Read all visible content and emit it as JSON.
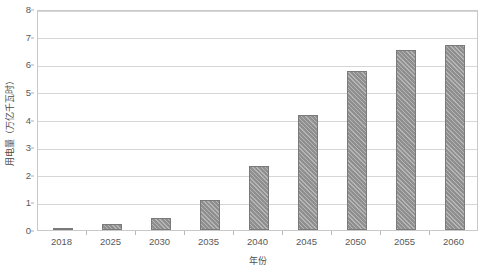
{
  "chart_data": {
    "type": "bar",
    "title": "",
    "subtitle": "",
    "xlabel": "年份",
    "ylabel": "用电量（万亿千瓦时）",
    "categories": [
      "2018",
      "2025",
      "2030",
      "2035",
      "2040",
      "2045",
      "2050",
      "2055",
      "2060"
    ],
    "values": [
      0.07,
      0.2,
      0.45,
      1.1,
      2.3,
      4.15,
      5.75,
      6.5,
      6.7
    ],
    "series": [
      {
        "name": "用电量",
        "values": [
          0.07,
          0.2,
          0.45,
          1.1,
          2.3,
          4.15,
          5.75,
          6.5,
          6.7
        ]
      }
    ],
    "ylim": [
      0,
      8
    ],
    "y_ticks": [
      0,
      1,
      2,
      3,
      4,
      5,
      6,
      7,
      8
    ],
    "y_tick_labels": [
      "0",
      "1",
      "2",
      "3",
      "4",
      "5",
      "6",
      "7",
      "8"
    ],
    "grid": "horizontal",
    "legend": "none",
    "bar_color": "#8f8f8f",
    "bar_border_color": "#7a7a7a",
    "bar_pattern": "diagonal-hatch",
    "gridline_color": "#d6d6d6",
    "plot_border_color": "#c9c9c9",
    "axis_text_color": "#595959",
    "background_color": "#ffffff"
  }
}
